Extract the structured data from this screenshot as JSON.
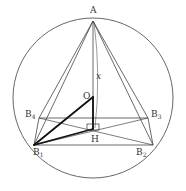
{
  "diagram": {
    "type": "geometry",
    "circle": {
      "cx": 93,
      "cy": 98,
      "r": 80
    },
    "points": {
      "A": {
        "x": 93,
        "y": 21,
        "label": "A",
        "sub": ""
      },
      "O": {
        "x": 93,
        "y": 97,
        "label": "O",
        "sub": ""
      },
      "H": {
        "x": 93,
        "y": 129,
        "label": "H",
        "sub": ""
      },
      "B1": {
        "x": 34,
        "y": 145,
        "label": "B",
        "sub": "1"
      },
      "B2": {
        "x": 153,
        "y": 145,
        "label": "B",
        "sub": "2"
      },
      "B3": {
        "x": 148,
        "y": 118,
        "label": "B",
        "sub": "3"
      },
      "B4": {
        "x": 39,
        "y": 118,
        "label": "B",
        "sub": "4"
      }
    },
    "variable_label": "x",
    "stroke_color": "#444444",
    "bold_color": "#111111"
  }
}
